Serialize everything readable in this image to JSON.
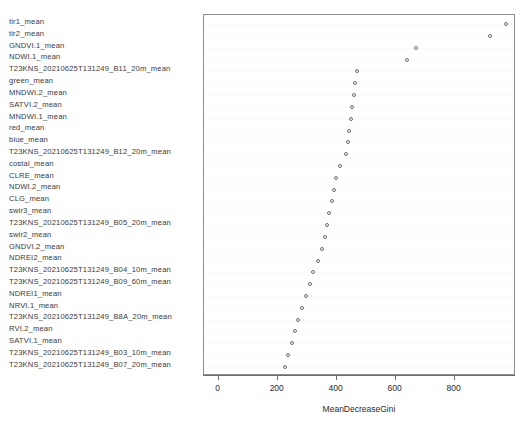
{
  "chart_data": {
    "type": "scatter",
    "title": "",
    "xlabel": "MeanDecreaseGini",
    "ylabel": "",
    "xlim": [
      -50,
      1008
    ],
    "grid": true,
    "legend": null,
    "xticks": [
      0,
      200,
      400,
      600,
      800
    ],
    "xtick_labels": [
      "0",
      "200",
      "400",
      "600",
      "800"
    ],
    "categories": [
      "tir1_mean",
      "tir2_mean",
      "GNDVI.1_mean",
      "NDWI.1_mean",
      "T23KNS_20210625T131249_B11_20m_mean",
      "green_mean",
      "MNDWI.2_mean",
      "SATVI.2_mean",
      "MNDWI.1_mean",
      "red_mean",
      "blue_mean",
      "T23KNS_20210625T131249_B12_20m_mean",
      "costal_mean",
      "CLRE_mean",
      "NDWI.2_mean",
      "CLG_mean",
      "swir3_mean",
      "T23KNS_20210625T131249_B05_20m_mean",
      "swir2_mean",
      "GNDVI.2_mean",
      "NDREI2_mean",
      "T23KNS_20210625T131249_B04_10m_mean",
      "T23KNS_20210625T131249_B09_60m_mean",
      "NDREI1_mean",
      "NRVI.1_mean",
      "T23KNS_20210625T131249_B8A_20m_mean",
      "RVI.2_mean",
      "SATVI.1_mean",
      "T23KNS_20210625T131249_B03_10m_mean",
      "T23KNS_20210625T131249_B07_20m_mean"
    ],
    "values": [
      975,
      921,
      669,
      639,
      470,
      463,
      458,
      451,
      447,
      442,
      437,
      430,
      410,
      397,
      390,
      383,
      373,
      366,
      359,
      350,
      336,
      319,
      311,
      295,
      281,
      270,
      258,
      248,
      235,
      225
    ],
    "point_style": {
      "marker": "open-circle",
      "color": "#6e6e6e",
      "size": 4
    }
  },
  "axis": {
    "x_title": "MeanDecreaseGini"
  }
}
